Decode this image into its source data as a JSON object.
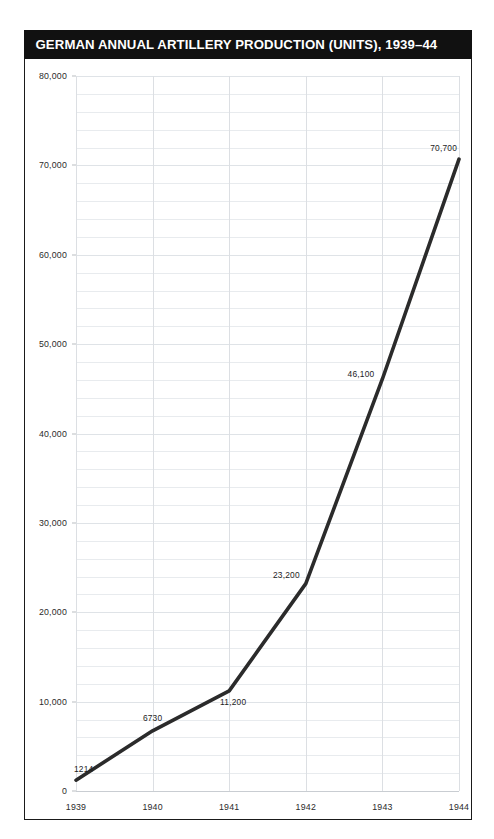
{
  "figure": {
    "title": "GERMAN ANNUAL ARTILLERY PRODUCTION (UNITS), 1939–44",
    "title_bar_color": "#111111",
    "title_text_color": "#ffffff",
    "line_color": "#2b2b2b",
    "grid_color": "#e8ebee",
    "background": "#ffffff"
  },
  "chart_data": {
    "type": "line",
    "title": "GERMAN ANNUAL ARTILLERY PRODUCTION (UNITS), 1939–44",
    "xlabel": "",
    "ylabel": "",
    "categories": [
      "1939",
      "1940",
      "1941",
      "1942",
      "1943",
      "1944"
    ],
    "x": [
      1939,
      1940,
      1941,
      1942,
      1943,
      1944
    ],
    "values": [
      1214,
      6730,
      11200,
      23200,
      46100,
      70700
    ],
    "point_labels": [
      "1214",
      "6730",
      "11,200",
      "23,200",
      "46,100",
      "70,700"
    ],
    "ylim": [
      0,
      80000
    ],
    "ytick_values": [
      0,
      10000,
      20000,
      30000,
      40000,
      50000,
      60000,
      70000,
      80000
    ],
    "ytick_labels": [
      "0",
      "10,000",
      "20,000",
      "30,000",
      "40,000",
      "50,000",
      "60,000",
      "70,000",
      "80,000"
    ],
    "xtick_labels": [
      "1939",
      "1940",
      "1941",
      "1942",
      "1943",
      "1944"
    ],
    "minor_ytick_step": 2000,
    "grid": true,
    "legend": false,
    "series": [
      {
        "name": "Artillery production (units)",
        "values": [
          1214,
          6730,
          11200,
          23200,
          46100,
          70700
        ]
      }
    ]
  }
}
